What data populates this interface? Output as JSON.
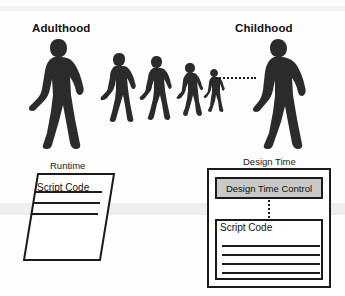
{
  "figure": {
    "title_left": "Adulthood",
    "title_right": "Childhood",
    "runtime_label": "Runtime",
    "design_time_label": "Design Time",
    "runtime_document": {
      "heading": "Script Code",
      "line_count": 3
    },
    "design_time": {
      "control_label": "Design Time Control",
      "script_heading": "Script Code",
      "script_line_count": 4
    },
    "walkers": [
      {
        "name": "adult-large",
        "x": 28,
        "y": 37,
        "w": 60,
        "h": 112
      },
      {
        "name": "walker-2",
        "x": 100,
        "y": 52,
        "w": 38,
        "h": 70
      },
      {
        "name": "walker-3",
        "x": 139,
        "y": 55,
        "w": 35,
        "h": 65
      },
      {
        "name": "walker-4",
        "x": 176,
        "y": 62,
        "w": 28,
        "h": 54
      },
      {
        "name": "walker-5",
        "x": 203,
        "y": 68,
        "w": 22,
        "h": 44
      },
      {
        "name": "child-large",
        "x": 252,
        "y": 37,
        "w": 58,
        "h": 112
      }
    ],
    "colors": {
      "figure_fill": "#2b2b2b",
      "stroke": "#1b1b1b",
      "control_fill": "#c9c9c9",
      "background": "#ffffff"
    }
  }
}
